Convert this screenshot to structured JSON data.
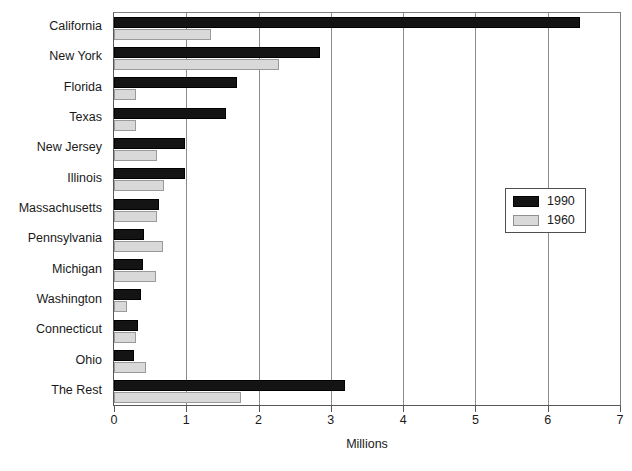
{
  "chart_data": {
    "type": "bar",
    "orientation": "horizontal",
    "title": "",
    "xlabel": "Millions",
    "ylabel": "",
    "xlim": [
      0,
      7
    ],
    "xticks": [
      0,
      1,
      2,
      3,
      4,
      5,
      6,
      7
    ],
    "xtick_labels": [
      "0",
      "1",
      "2",
      "3",
      "4",
      "5",
      "6",
      "7"
    ],
    "grid": true,
    "grid_axis": "x",
    "legend_position": "center-right",
    "categories": [
      "California",
      "New York",
      "Florida",
      "Texas",
      "New Jersey",
      "Illinois",
      "Massachusetts",
      "Pennsylvania",
      "Michigan",
      "Washington",
      "Connecticut",
      "Ohio",
      "The Rest"
    ],
    "series": [
      {
        "name": "1990",
        "color": "#141414",
        "values": [
          6.45,
          2.85,
          1.7,
          1.55,
          0.98,
          0.98,
          0.62,
          0.41,
          0.4,
          0.37,
          0.33,
          0.28,
          3.2
        ]
      },
      {
        "name": "1960",
        "color": "#d9d9d9",
        "values": [
          1.34,
          2.28,
          0.3,
          0.3,
          0.59,
          0.69,
          0.59,
          0.68,
          0.58,
          0.18,
          0.3,
          0.44,
          1.75
        ]
      }
    ]
  }
}
